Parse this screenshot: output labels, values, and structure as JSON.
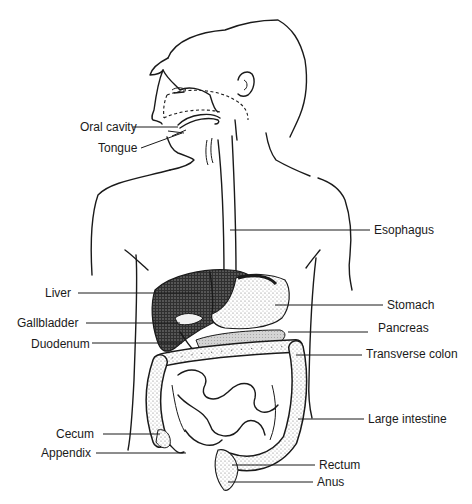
{
  "diagram": {
    "colors": {
      "ink": "#1a1a1a",
      "background": "#ffffff",
      "liver_fill": "#3a3a3a",
      "stipple": "#8a8a8a",
      "pancreas_fill": "#cfcfcf"
    },
    "labels": [
      {
        "id": "oral-cavity",
        "text": "Oral cavity",
        "side": "left",
        "x": 80,
        "y": 120
      },
      {
        "id": "tongue",
        "text": "Tongue",
        "side": "left",
        "x": 98,
        "y": 141
      },
      {
        "id": "esophagus",
        "text": "Esophagus",
        "side": "right",
        "x": 374,
        "y": 223
      },
      {
        "id": "liver",
        "text": "Liver",
        "side": "left",
        "x": 45,
        "y": 286
      },
      {
        "id": "stomach",
        "text": "Stomach",
        "side": "right",
        "x": 387,
        "y": 298
      },
      {
        "id": "gallbladder",
        "text": "Gallbladder",
        "side": "left",
        "x": 17,
        "y": 316
      },
      {
        "id": "pancreas",
        "text": "Pancreas",
        "side": "right",
        "x": 378,
        "y": 321
      },
      {
        "id": "duodenum",
        "text": "Duodenum",
        "side": "left",
        "x": 31,
        "y": 337
      },
      {
        "id": "transverse-colon",
        "text": "Transverse colon",
        "side": "right",
        "x": 366,
        "y": 347
      },
      {
        "id": "large-intestine",
        "text": "Large intestine",
        "side": "right",
        "x": 368,
        "y": 412
      },
      {
        "id": "cecum",
        "text": "Cecum",
        "side": "left",
        "x": 56,
        "y": 427
      },
      {
        "id": "appendix",
        "text": "Appendix",
        "side": "left",
        "x": 41,
        "y": 446
      },
      {
        "id": "rectum",
        "text": "Rectum",
        "side": "right",
        "x": 319,
        "y": 458
      },
      {
        "id": "anus",
        "text": "Anus",
        "side": "right",
        "x": 317,
        "y": 475
      }
    ]
  }
}
